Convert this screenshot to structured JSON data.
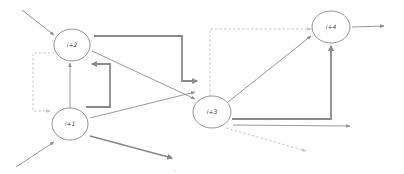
{
  "diagram": {
    "type": "flow-network",
    "colors": {
      "node_stroke": "#8a8a8a",
      "edge": "#8f8f8f",
      "edge_thick": "#8a8a8a",
      "dashed": "#c4c4c4",
      "label": "#444444"
    },
    "nodes": [
      {
        "id": "i2",
        "label": "i+2",
        "cx": 72,
        "cy": 45,
        "rx": 18,
        "ry": 16
      },
      {
        "id": "i1",
        "label": "i+1",
        "cx": 70,
        "cy": 124,
        "rx": 18,
        "ry": 16
      },
      {
        "id": "i3",
        "label": "i+3",
        "cx": 212,
        "cy": 112,
        "rx": 19,
        "ry": 16
      },
      {
        "id": "i4",
        "label": "i+4",
        "cx": 331,
        "cy": 27,
        "rx": 19,
        "ry": 16
      }
    ],
    "edges": [
      {
        "from": "external",
        "to": "i+2",
        "style": "thin"
      },
      {
        "from": "external",
        "to": "i+1",
        "style": "thin"
      },
      {
        "from": "i+1",
        "to": "i+2",
        "style": "thin"
      },
      {
        "from": "i+1",
        "to": "i+2",
        "style": "thick-feedback"
      },
      {
        "from": "i+2",
        "to": "i+1",
        "style": "dashed"
      },
      {
        "from": "i+2",
        "to": "i+3",
        "style": "thick"
      },
      {
        "from": "i+2",
        "to": "i+3",
        "style": "thin"
      },
      {
        "from": "i+1",
        "to": "i+3",
        "style": "thin"
      },
      {
        "from": "i+1",
        "to": "external",
        "style": "thick"
      },
      {
        "from": "i+3",
        "to": "i+4",
        "style": "thin"
      },
      {
        "from": "i+3",
        "to": "i+4",
        "style": "thick"
      },
      {
        "from": "i+3",
        "to": "i+4",
        "style": "dashed"
      },
      {
        "from": "i+3",
        "to": "external",
        "style": "thin"
      },
      {
        "from": "i+3",
        "to": "external",
        "style": "dashed"
      },
      {
        "from": "i+4",
        "to": "external",
        "style": "thin"
      }
    ]
  }
}
